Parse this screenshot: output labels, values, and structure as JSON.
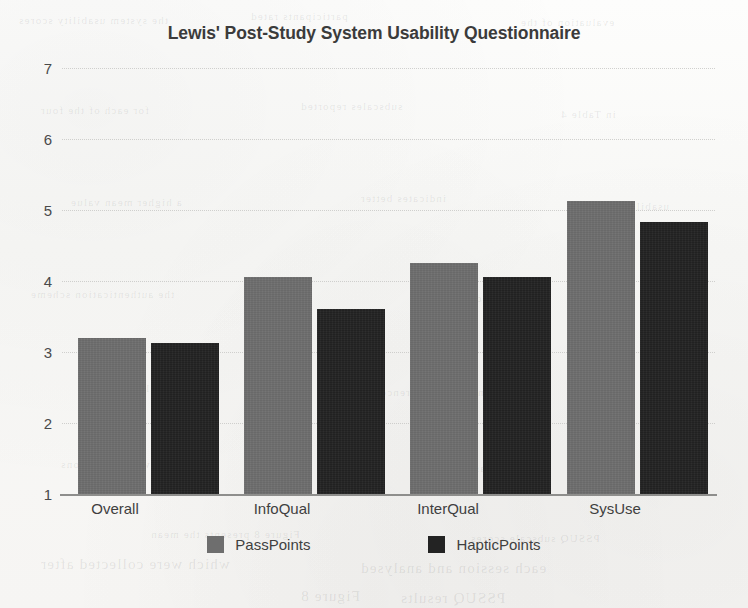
{
  "chart_data": {
    "type": "bar",
    "title": "Lewis' Post-Study System Usability Questionnaire",
    "xlabel": "",
    "ylabel": "",
    "categories": [
      "Overall",
      "InfoQual",
      "InterQual",
      "SysUse"
    ],
    "series": [
      {
        "name": "PassPoints",
        "color": "#6e6e6e",
        "values": [
          3.2,
          4.05,
          4.25,
          5.13
        ]
      },
      {
        "name": "HapticPoints",
        "color": "#232323",
        "values": [
          3.12,
          3.6,
          4.05,
          4.83
        ]
      }
    ],
    "ylim": [
      1,
      7
    ],
    "yticks": [
      1,
      2,
      3,
      4,
      5,
      6,
      7
    ],
    "ytick_labels": [
      "1",
      "2",
      "3",
      "4",
      "5",
      "6",
      "7"
    ],
    "grid": true,
    "legend_position": "bottom"
  },
  "page_texture": {
    "bleed_lines": [
      {
        "text": "the system usability scores",
        "x": 18,
        "y": 14,
        "size": "sm"
      },
      {
        "text": "participants rated",
        "x": 250,
        "y": 10,
        "size": "sm"
      },
      {
        "text": "evaluation of the",
        "x": 520,
        "y": 16,
        "size": "sm"
      },
      {
        "text": "for each of the four",
        "x": 40,
        "y": 104,
        "size": "sm"
      },
      {
        "text": "subscales reported",
        "x": 300,
        "y": 100,
        "size": "sm"
      },
      {
        "text": "in Table 4",
        "x": 560,
        "y": 108,
        "size": "sm"
      },
      {
        "text": "a higher mean value",
        "x": 70,
        "y": 196,
        "size": "sm"
      },
      {
        "text": "indicates better",
        "x": 360,
        "y": 192,
        "size": "sm"
      },
      {
        "text": "usability for",
        "x": 600,
        "y": 200,
        "size": "sm"
      },
      {
        "text": "the authentication scheme",
        "x": 30,
        "y": 288,
        "size": "sm"
      },
      {
        "text": "under study",
        "x": 430,
        "y": 292,
        "size": "sm"
      },
      {
        "text": "results suggest",
        "x": 90,
        "y": 382,
        "size": "sm"
      },
      {
        "text": "no significant difference",
        "x": 380,
        "y": 386,
        "size": "sm"
      },
      {
        "text": "between conditions",
        "x": 60,
        "y": 458,
        "size": "sm"
      },
      {
        "text": "as shown in",
        "x": 420,
        "y": 462,
        "size": "sm"
      },
      {
        "text": "Figure 8 presents the mean",
        "x": 150,
        "y": 528,
        "size": "sm"
      },
      {
        "text": "PSSUQ subscale scores",
        "x": 470,
        "y": 532,
        "size": "sm"
      },
      {
        "text": "which were collected after",
        "x": 40,
        "y": 556,
        "size": "lg"
      },
      {
        "text": "each session and analysed",
        "x": 360,
        "y": 560,
        "size": "lg"
      },
      {
        "text": "Figure 8",
        "x": 300,
        "y": 588,
        "size": "lg"
      },
      {
        "text": "PSSUQ results",
        "x": 400,
        "y": 590,
        "size": "lg"
      }
    ]
  }
}
